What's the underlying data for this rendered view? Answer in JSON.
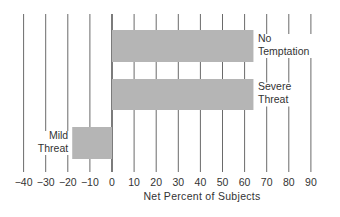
{
  "chart_data": {
    "type": "bar",
    "orientation": "horizontal",
    "title": "",
    "xlabel": "Net Percent of Subjects",
    "ylabel": "",
    "xlim": [
      -40,
      90
    ],
    "xticks": [
      -40,
      -30,
      -20,
      -10,
      0,
      10,
      20,
      30,
      40,
      50,
      60,
      70,
      80,
      90
    ],
    "xtick_labels": [
      "−40",
      "−30",
      "−20",
      "−10",
      "0",
      "10",
      "20",
      "30",
      "40",
      "50",
      "60",
      "70",
      "80",
      "90"
    ],
    "grid": "vertical",
    "categories": [
      [
        "No",
        "Temptation"
      ],
      [
        "Severe",
        "Threat"
      ],
      [
        "Mild",
        "Threat"
      ]
    ],
    "values": [
      64,
      64,
      -18
    ],
    "bar_color": "#b5b5b5"
  }
}
